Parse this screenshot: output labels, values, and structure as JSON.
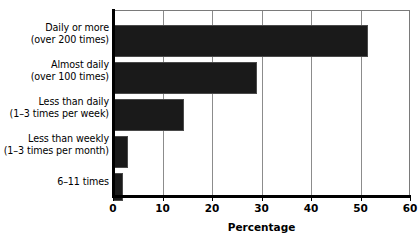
{
  "chart_data": {
    "type": "bar",
    "orientation": "horizontal",
    "title": "",
    "xlabel": "Percentage",
    "ylabel": "",
    "xlim": [
      0,
      60
    ],
    "xticks": [
      "0",
      "10",
      "20",
      "30",
      "40",
      "50",
      "60"
    ],
    "grid": "vertical",
    "legend": "none",
    "bar_color": "#1a1a1a",
    "categories": [
      "Daily or more (over 200 times)",
      "Almost daily (over 100 times)",
      "Less than daily (1–3 times per week)",
      "Less than weekly (1–3 times per month)",
      "6–11 times"
    ],
    "category_lines": [
      [
        "Daily or more",
        "(over 200 times)"
      ],
      [
        "Almost daily",
        "(over 100 times)"
      ],
      [
        "Less than daily",
        "(1–3 times per week)"
      ],
      [
        "Less than weekly",
        "(1–3 times per month)"
      ],
      [
        "6–11 times"
      ]
    ],
    "values": [
      51.5,
      29.0,
      14.3,
      3.0,
      2.0
    ]
  }
}
